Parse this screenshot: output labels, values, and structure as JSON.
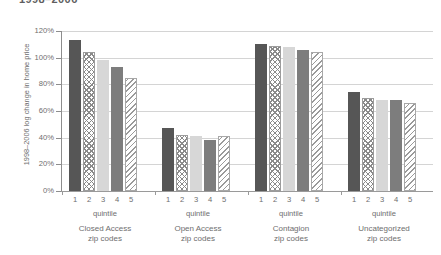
{
  "chart_data": {
    "type": "bar",
    "title": "1998–2006",
    "ylabel": "1998–2006 log change in home price",
    "xlabel": "quintile",
    "ylim": [
      0,
      120
    ],
    "ytick_labels": [
      "120%",
      "100%",
      "80%",
      "60%",
      "40%",
      "20%",
      "0%"
    ],
    "ytick_values": [
      120,
      100,
      80,
      60,
      40,
      20,
      0
    ],
    "grid": true,
    "legend": "none",
    "categories": [
      "1",
      "2",
      "3",
      "4",
      "5"
    ],
    "group_sublabel": "quintile",
    "groups": [
      {
        "name": "Closed Access\nzip codes",
        "name_line1": "Closed Access",
        "name_line2": "zip codes",
        "values": [
          113,
          104,
          98,
          93,
          85
        ]
      },
      {
        "name": "Open Access\nzip codes",
        "name_line1": "Open Access",
        "name_line2": "zip codes",
        "values": [
          47,
          42,
          41,
          38,
          41
        ]
      },
      {
        "name": "Contagion\nzip codes",
        "name_line1": "Contagion",
        "name_line2": "zip codes",
        "values": [
          110,
          109,
          108,
          106,
          104
        ]
      },
      {
        "name": "Uncategorized\nzip codes",
        "name_line1": "Uncategorized",
        "name_line2": "zip codes",
        "values": [
          74,
          70,
          68,
          68,
          66
        ]
      }
    ],
    "series_styles": [
      {
        "quintile": "1",
        "fill": "#565656",
        "pattern": "solid-dark"
      },
      {
        "quintile": "2",
        "fill": "#ffffff",
        "pattern": "crosshatch"
      },
      {
        "quintile": "3",
        "fill": "#d7d7d7",
        "pattern": "solid-light"
      },
      {
        "quintile": "4",
        "fill": "#7d7d7d",
        "pattern": "solid-medium"
      },
      {
        "quintile": "5",
        "fill": "#ffffff",
        "pattern": "diagonal-hatch"
      }
    ],
    "colors": {
      "gridline": "#d4d4d4",
      "axis": "#8d8d8d",
      "text": "#6e6e6e"
    }
  }
}
